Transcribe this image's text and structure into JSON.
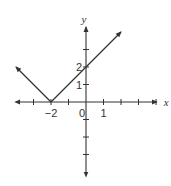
{
  "chart_data": {
    "type": "line",
    "title": "",
    "function": "y = |x + 2|",
    "xlabel": "x",
    "ylabel": "y",
    "xlim": [
      -4.1,
      4.1
    ],
    "ylim": [
      -4.2,
      4.4
    ],
    "x_ticks": [
      -3,
      -2,
      -1,
      0,
      1,
      2,
      3,
      4
    ],
    "y_ticks": [
      -3,
      -2,
      -1,
      1,
      2,
      3
    ],
    "x_tick_labels": [
      {
        "value": -2,
        "text": "−2"
      },
      {
        "value": 0,
        "text": "0"
      },
      {
        "value": 1,
        "text": "1"
      }
    ],
    "y_tick_labels": [
      {
        "value": 2,
        "text": "2"
      },
      {
        "value": 1,
        "text": "1"
      }
    ],
    "series": [
      {
        "name": "left-branch",
        "points": [
          [
            -2,
            0
          ],
          [
            -4,
            2
          ]
        ],
        "arrow_end": true
      },
      {
        "name": "right-branch",
        "points": [
          [
            -2,
            0
          ],
          [
            2,
            4
          ]
        ],
        "arrow_end": true
      }
    ],
    "grid": false,
    "color": "#333333"
  }
}
